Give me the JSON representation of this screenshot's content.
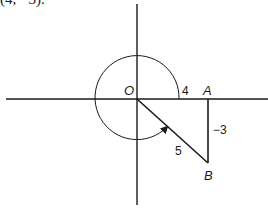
{
  "caption": "(4, −3).",
  "diagram": {
    "origin_label": "O",
    "point_a_label": "A",
    "point_b_label": "B",
    "x_value_label": "4",
    "y_value_label": "−3",
    "hypotenuse_label": "5",
    "colors": {
      "stroke": "#1a1a1a",
      "background": "#ffffff"
    },
    "geometry": {
      "origin": [
        137,
        99
      ],
      "circle_radius": 42,
      "point_a": [
        208,
        99
      ],
      "point_b": [
        208,
        163
      ],
      "angle_direction": "counterclockwise from positive x-axis to OB"
    }
  }
}
